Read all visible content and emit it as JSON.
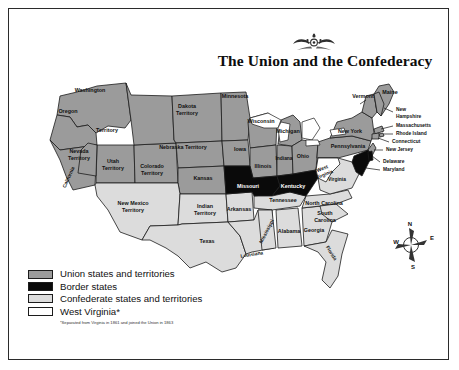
{
  "title": "The Union and the Confederacy",
  "ornament_name": "decorative-flourish",
  "legend": {
    "items": [
      {
        "label": "Union states and territories",
        "color": "#9b9b9b",
        "key": "union"
      },
      {
        "label": "Border states",
        "color": "#0a0a0a",
        "key": "border"
      },
      {
        "label": "Confederate states and territories",
        "color": "#dcdcdc",
        "key": "confederate"
      },
      {
        "label": "West Virginia*",
        "color": "#ffffff",
        "key": "west-virginia"
      }
    ],
    "footnote": "*Separated from Virginia in 1861 and joined the Union in 1863"
  },
  "compass": {
    "north": "N",
    "east": "E",
    "south": "S",
    "west": "W"
  },
  "map": {
    "labels": [
      {
        "name": "washington-territory",
        "text": "Washington",
        "x": 90,
        "y": 92,
        "cls": "lbl"
      },
      {
        "name": "washington-territory-2",
        "text": "Territory",
        "x": 107,
        "y": 132,
        "cls": "lbl"
      },
      {
        "name": "oregon",
        "text": "Oregon",
        "x": 68,
        "y": 113,
        "cls": "lbl"
      },
      {
        "name": "nevada-territory",
        "text": "Nevada",
        "x": 79,
        "y": 153,
        "cls": "lbl"
      },
      {
        "name": "nevada-territory-2",
        "text": "Territory",
        "x": 79,
        "y": 160,
        "cls": "lbl"
      },
      {
        "name": "utah-territory",
        "text": "Utah",
        "x": 113,
        "y": 163,
        "cls": "lbl"
      },
      {
        "name": "utah-territory-2",
        "text": "Territory",
        "x": 113,
        "y": 170,
        "cls": "lbl"
      },
      {
        "name": "colorado-territory",
        "text": "Colorado",
        "x": 152,
        "y": 168,
        "cls": "lbl"
      },
      {
        "name": "colorado-territory-2",
        "text": "Territory",
        "x": 152,
        "y": 175,
        "cls": "lbl"
      },
      {
        "name": "dakota-territory",
        "text": "Dakota",
        "x": 187,
        "y": 108,
        "cls": "lbl"
      },
      {
        "name": "dakota-territory-2",
        "text": "Territory",
        "x": 187,
        "y": 115,
        "cls": "lbl"
      },
      {
        "name": "nebraska-territory",
        "text": "Nebraska Territory",
        "x": 183,
        "y": 149,
        "cls": "lbl"
      },
      {
        "name": "kansas",
        "text": "Kansas",
        "x": 203,
        "y": 180,
        "cls": "lbl"
      },
      {
        "name": "minnesota",
        "text": "Minnesota",
        "x": 235,
        "y": 98,
        "cls": "lbl"
      },
      {
        "name": "wisconsin",
        "text": "Wisconsin",
        "x": 261,
        "y": 123,
        "cls": "lbl"
      },
      {
        "name": "iowa",
        "text": "Iowa",
        "x": 240,
        "y": 151,
        "cls": "lbl"
      },
      {
        "name": "illinois",
        "text": "Illinois",
        "x": 263,
        "y": 168,
        "cls": "lbl"
      },
      {
        "name": "michigan",
        "text": "Michigan",
        "x": 288,
        "y": 133,
        "cls": "lbl"
      },
      {
        "name": "indiana",
        "text": "Indiana",
        "x": 284,
        "y": 160,
        "cls": "lbl tiny"
      },
      {
        "name": "ohio",
        "text": "Ohio",
        "x": 303,
        "y": 158,
        "cls": "lbl"
      },
      {
        "name": "missouri",
        "text": "Missouri",
        "x": 248,
        "y": 188,
        "cls": "lbl on-dark"
      },
      {
        "name": "kentucky",
        "text": "Kentucky",
        "x": 293,
        "y": 188,
        "cls": "lbl on-dark"
      },
      {
        "name": "new-mexico-territory",
        "text": "New Mexico",
        "x": 133,
        "y": 205,
        "cls": "lbl"
      },
      {
        "name": "new-mexico-territory-2",
        "text": "Territory",
        "x": 133,
        "y": 212,
        "cls": "lbl"
      },
      {
        "name": "indian-territory",
        "text": "Indian",
        "x": 205,
        "y": 208,
        "cls": "lbl"
      },
      {
        "name": "indian-territory-2",
        "text": "Territory",
        "x": 205,
        "y": 215,
        "cls": "lbl"
      },
      {
        "name": "arkansas",
        "text": "Arkansas",
        "x": 239,
        "y": 211,
        "cls": "lbl"
      },
      {
        "name": "tennessee",
        "text": "Tennessee",
        "x": 283,
        "y": 202,
        "cls": "lbl"
      },
      {
        "name": "texas",
        "text": "Texas",
        "x": 207,
        "y": 243,
        "cls": "lbl"
      },
      {
        "name": "alabama",
        "text": "Alabama",
        "x": 289,
        "y": 233,
        "cls": "lbl"
      },
      {
        "name": "georgia",
        "text": "Georgia",
        "x": 314,
        "y": 232,
        "cls": "lbl"
      },
      {
        "name": "north-carolina",
        "text": "North Carolina",
        "x": 324,
        "y": 205,
        "cls": "lbl"
      },
      {
        "name": "south-carolina",
        "text": "South",
        "x": 325,
        "y": 215,
        "cls": "lbl"
      },
      {
        "name": "south-carolina-2",
        "text": "Carolina",
        "x": 325,
        "y": 222,
        "cls": "lbl"
      },
      {
        "name": "virginia",
        "text": "Virginia",
        "x": 337,
        "y": 181,
        "cls": "lbl tiny"
      },
      {
        "name": "new-york",
        "text": "New York",
        "x": 350,
        "y": 133,
        "cls": "lbl"
      },
      {
        "name": "pennsylvania",
        "text": "Pennsylvania",
        "x": 348,
        "y": 148,
        "cls": "lbl"
      },
      {
        "name": "vermont",
        "text": "Vermont",
        "x": 363,
        "y": 98,
        "cls": "lbl"
      },
      {
        "name": "maine",
        "text": "Maine",
        "x": 390,
        "y": 94,
        "cls": "lbl"
      }
    ],
    "callouts": [
      {
        "name": "new-hampshire",
        "text": "New",
        "x": 396,
        "y": 111
      },
      {
        "name": "new-hampshire-2",
        "text": "Hampshire",
        "x": 396,
        "y": 118
      },
      {
        "name": "massachusetts",
        "text": "Massachusetts",
        "x": 396,
        "y": 127
      },
      {
        "name": "rhode-island",
        "text": "Rhode Island",
        "x": 396,
        "y": 135
      },
      {
        "name": "connecticut",
        "text": "Connecticut",
        "x": 392,
        "y": 143
      },
      {
        "name": "new-jersey",
        "text": "New Jersey",
        "x": 386,
        "y": 151
      },
      {
        "name": "delaware",
        "text": "Delaware",
        "x": 383,
        "y": 163
      },
      {
        "name": "maryland",
        "text": "Maryland",
        "x": 383,
        "y": 171
      }
    ],
    "rotated_labels": [
      {
        "name": "california",
        "text": "California",
        "x": 70,
        "y": 178,
        "rot": -66
      },
      {
        "name": "mississippi",
        "text": "Mississippi",
        "x": 268,
        "y": 232,
        "rot": -63
      },
      {
        "name": "louisiana",
        "text": "Louisiana",
        "x": 252,
        "y": 256,
        "rot": -9
      },
      {
        "name": "florida",
        "text": "Florida",
        "x": 330,
        "y": 254,
        "rot": 58
      },
      {
        "name": "west-virginia",
        "text": "West",
        "x": 323,
        "y": 170,
        "rot": -22
      },
      {
        "name": "west-virginia-2",
        "text": "Virginia",
        "x": 325,
        "y": 176,
        "rot": -22
      }
    ]
  }
}
